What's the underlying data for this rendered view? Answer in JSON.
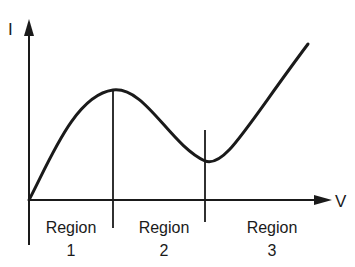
{
  "diagram": {
    "title": "",
    "y_axis_label": "I",
    "x_axis_label": "V",
    "regions": [
      {
        "word": "Region",
        "number": "1"
      },
      {
        "word": "Region",
        "number": "2"
      },
      {
        "word": "Region",
        "number": "3"
      }
    ],
    "curve_description": "I-V characteristic rising to a peak, falling to a valley, then rising linearly",
    "colors": {
      "ink": "#1a1a1a",
      "background": "#ffffff"
    }
  }
}
